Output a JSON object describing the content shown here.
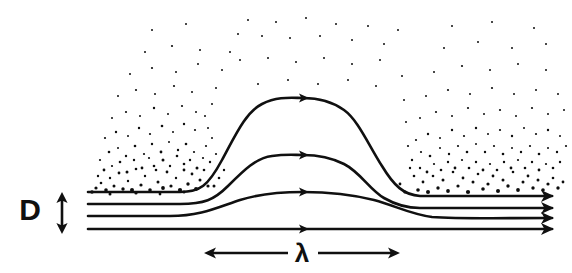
{
  "figure": {
    "type": "schematic-diagram",
    "background_color": "#ffffff",
    "ink_color": "#101010",
    "width": 572,
    "height": 273
  },
  "labels": {
    "depth": {
      "text": "D",
      "meaning": "layer depth",
      "x": 30,
      "y": 220
    },
    "wavelength": {
      "text": "λ",
      "meaning": "wavelength",
      "x": 302,
      "y": 262
    }
  },
  "dimension_arrows": [
    {
      "name": "depth-arrow",
      "orientation": "vertical",
      "double_headed": true,
      "x": 62,
      "y_top": 192,
      "y_bottom": 234
    },
    {
      "name": "wavelength-arrow-left",
      "orientation": "horizontal",
      "double_headed": false,
      "head": "left",
      "y": 253,
      "x_start": 288,
      "x_end": 204
    },
    {
      "name": "wavelength-arrow-right",
      "orientation": "horizontal",
      "double_headed": false,
      "head": "right",
      "y": 253,
      "x_start": 318,
      "x_end": 400
    }
  ],
  "streamlines": [
    {
      "name": "streamline-top",
      "index": 0,
      "y_inlet": 192,
      "y_outlet": 196,
      "crest_y": 98,
      "crest_x": 303,
      "amplitude": 94,
      "path": "M 88 192 L 180 192 C 200 192 208 186 222 160 C 236 134 246 112 262 104 C 278 96 292 98 303 98 C 316 98 330 100 344 110 C 358 120 368 144 382 166 C 394 186 404 195 420 196 L 552 196",
      "arrow_at_x": 303
    },
    {
      "name": "streamline-second",
      "index": 1,
      "y_inlet": 204,
      "y_outlet": 208,
      "crest_y": 155,
      "crest_x": 303,
      "amplitude": 50,
      "path": "M 88 204 L 180 204 C 204 204 214 200 228 186 C 244 170 256 158 272 156 C 286 154 294 155 303 155 C 316 155 330 157 344 164 C 360 172 370 190 384 198 C 396 205 406 208 420 208 L 552 208",
      "arrow_at_x": 303
    },
    {
      "name": "streamline-third",
      "index": 2,
      "y_inlet": 216,
      "y_outlet": 218,
      "crest_y": 192,
      "crest_x": 303,
      "amplitude": 25,
      "path": "M 88 216 L 170 216 C 200 216 216 208 240 200 C 262 193 284 192 303 192 C 326 192 350 194 374 200 C 396 206 410 214 432 217 C 460 219 500 218 552 218",
      "arrow_at_x": 303
    },
    {
      "name": "streamline-bottom",
      "index": 3,
      "y_inlet": 229,
      "y_outlet": 229,
      "crest_y": 229,
      "crest_x": 303,
      "amplitude": 0,
      "path": "M 88 229 L 552 229",
      "arrow_at_x": 303
    }
  ],
  "outlet_arrow_heads": [
    {
      "name": "outlet-arrow-1",
      "x": 552,
      "y": 196
    },
    {
      "name": "outlet-arrow-2",
      "x": 552,
      "y": 208
    },
    {
      "name": "outlet-arrow-3",
      "x": 552,
      "y": 218
    },
    {
      "name": "outlet-arrow-4",
      "x": 552,
      "y": 229
    }
  ],
  "mid_arrow_heads": [
    {
      "name": "mid-arrow-1",
      "x": 303,
      "y": 98
    },
    {
      "name": "mid-arrow-2",
      "x": 303,
      "y": 155
    },
    {
      "name": "mid-arrow-3",
      "x": 303,
      "y": 192
    },
    {
      "name": "mid-arrow-4",
      "x": 303,
      "y": 229
    }
  ],
  "particle_field": {
    "name": "turbulent-particle-speckle",
    "description": "scattered dots above the top streamline, densest just above the streamline and thinning with height",
    "count": 243,
    "dots": [
      [
        96,
        188,
        1.6
      ],
      [
        101,
        183,
        1.3
      ],
      [
        106,
        190,
        1.8
      ],
      [
        110,
        178,
        1.2
      ],
      [
        114,
        186,
        1.5
      ],
      [
        119,
        173,
        1.4
      ],
      [
        123,
        189,
        1.7
      ],
      [
        128,
        181,
        1.2
      ],
      [
        132,
        190,
        2.0
      ],
      [
        136,
        169,
        1.3
      ],
      [
        141,
        185,
        1.6
      ],
      [
        145,
        176,
        1.2
      ],
      [
        150,
        190,
        1.8
      ],
      [
        154,
        166,
        1.3
      ],
      [
        158,
        182,
        1.5
      ],
      [
        163,
        188,
        1.9
      ],
      [
        167,
        172,
        1.4
      ],
      [
        171,
        186,
        1.6
      ],
      [
        176,
        178,
        1.2
      ],
      [
        180,
        190,
        2.1
      ],
      [
        184,
        164,
        1.3
      ],
      [
        188,
        184,
        1.7
      ],
      [
        192,
        174,
        1.4
      ],
      [
        196,
        189,
        1.9
      ],
      [
        200,
        180,
        1.5
      ],
      [
        204,
        170,
        1.3
      ],
      [
        208,
        186,
        1.6
      ],
      [
        98,
        176,
        1.2
      ],
      [
        104,
        170,
        1.4
      ],
      [
        112,
        166,
        1.1
      ],
      [
        120,
        162,
        1.3
      ],
      [
        127,
        172,
        1.5
      ],
      [
        134,
        160,
        1.2
      ],
      [
        142,
        168,
        1.4
      ],
      [
        149,
        158,
        1.1
      ],
      [
        156,
        170,
        1.3
      ],
      [
        163,
        160,
        1.5
      ],
      [
        170,
        166,
        1.2
      ],
      [
        177,
        156,
        1.3
      ],
      [
        184,
        170,
        1.4
      ],
      [
        190,
        160,
        1.2
      ],
      [
        197,
        168,
        1.5
      ],
      [
        203,
        158,
        1.1
      ],
      [
        100,
        160,
        1.1
      ],
      [
        109,
        152,
        1.3
      ],
      [
        118,
        148,
        1.0
      ],
      [
        126,
        156,
        1.2
      ],
      [
        135,
        146,
        1.3
      ],
      [
        144,
        154,
        1.1
      ],
      [
        152,
        144,
        1.2
      ],
      [
        161,
        152,
        1.4
      ],
      [
        169,
        142,
        1.0
      ],
      [
        178,
        150,
        1.2
      ],
      [
        186,
        144,
        1.3
      ],
      [
        194,
        152,
        1.1
      ],
      [
        105,
        138,
        1.1
      ],
      [
        116,
        132,
        1.2
      ],
      [
        128,
        136,
        1.0
      ],
      [
        139,
        128,
        1.2
      ],
      [
        150,
        134,
        1.1
      ],
      [
        162,
        126,
        1.3
      ],
      [
        173,
        132,
        1.0
      ],
      [
        184,
        124,
        1.2
      ],
      [
        195,
        130,
        1.1
      ],
      [
        112,
        118,
        1.0
      ],
      [
        126,
        112,
        1.1
      ],
      [
        140,
        116,
        1.0
      ],
      [
        154,
        108,
        1.2
      ],
      [
        168,
        114,
        1.0
      ],
      [
        182,
        106,
        1.1
      ],
      [
        196,
        112,
        1.0
      ],
      [
        118,
        96,
        1.0
      ],
      [
        136,
        90,
        1.1
      ],
      [
        155,
        94,
        1.0
      ],
      [
        174,
        86,
        1.1
      ],
      [
        192,
        92,
        1.0
      ],
      [
        130,
        74,
        1.0
      ],
      [
        152,
        68,
        1.1
      ],
      [
        176,
        72,
        1.0
      ],
      [
        198,
        64,
        1.0
      ],
      [
        145,
        52,
        1.0
      ],
      [
        172,
        46,
        1.1
      ],
      [
        200,
        50,
        1.0
      ],
      [
        152,
        30,
        1.0
      ],
      [
        186,
        24,
        1.0
      ],
      [
        418,
        190,
        1.8
      ],
      [
        423,
        182,
        1.4
      ],
      [
        428,
        192,
        2.0
      ],
      [
        433,
        176,
        1.3
      ],
      [
        438,
        188,
        1.7
      ],
      [
        443,
        180,
        1.5
      ],
      [
        448,
        191,
        1.9
      ],
      [
        453,
        172,
        1.3
      ],
      [
        458,
        186,
        1.6
      ],
      [
        463,
        178,
        1.4
      ],
      [
        468,
        192,
        2.1
      ],
      [
        473,
        182,
        1.5
      ],
      [
        478,
        174,
        1.3
      ],
      [
        483,
        189,
        1.8
      ],
      [
        488,
        184,
        1.6
      ],
      [
        493,
        176,
        1.4
      ],
      [
        498,
        191,
        2.0
      ],
      [
        503,
        180,
        1.5
      ],
      [
        508,
        186,
        1.7
      ],
      [
        513,
        172,
        1.3
      ],
      [
        518,
        190,
        1.9
      ],
      [
        523,
        182,
        1.5
      ],
      [
        528,
        176,
        1.4
      ],
      [
        533,
        188,
        1.7
      ],
      [
        538,
        180,
        1.5
      ],
      [
        543,
        190,
        1.8
      ],
      [
        548,
        184,
        1.6
      ],
      [
        553,
        178,
        1.3
      ],
      [
        558,
        188,
        1.7
      ],
      [
        563,
        182,
        1.4
      ],
      [
        414,
        176,
        1.3
      ],
      [
        420,
        168,
        1.2
      ],
      [
        427,
        172,
        1.4
      ],
      [
        434,
        164,
        1.1
      ],
      [
        441,
        170,
        1.3
      ],
      [
        448,
        162,
        1.2
      ],
      [
        455,
        168,
        1.4
      ],
      [
        462,
        160,
        1.1
      ],
      [
        469,
        168,
        1.3
      ],
      [
        476,
        162,
        1.2
      ],
      [
        483,
        170,
        1.4
      ],
      [
        490,
        164,
        1.1
      ],
      [
        497,
        170,
        1.3
      ],
      [
        504,
        162,
        1.2
      ],
      [
        511,
        168,
        1.4
      ],
      [
        518,
        160,
        1.1
      ],
      [
        525,
        168,
        1.3
      ],
      [
        532,
        162,
        1.2
      ],
      [
        539,
        170,
        1.4
      ],
      [
        546,
        164,
        1.1
      ],
      [
        553,
        168,
        1.3
      ],
      [
        560,
        162,
        1.2
      ],
      [
        412,
        160,
        1.2
      ],
      [
        421,
        152,
        1.1
      ],
      [
        430,
        156,
        1.3
      ],
      [
        440,
        148,
        1.0
      ],
      [
        449,
        154,
        1.2
      ],
      [
        458,
        146,
        1.1
      ],
      [
        467,
        152,
        1.3
      ],
      [
        476,
        144,
        1.0
      ],
      [
        485,
        152,
        1.2
      ],
      [
        494,
        146,
        1.1
      ],
      [
        503,
        154,
        1.3
      ],
      [
        512,
        148,
        1.0
      ],
      [
        521,
        152,
        1.2
      ],
      [
        530,
        146,
        1.1
      ],
      [
        539,
        154,
        1.3
      ],
      [
        548,
        148,
        1.0
      ],
      [
        557,
        152,
        1.2
      ],
      [
        566,
        146,
        1.1
      ],
      [
        416,
        140,
        1.1
      ],
      [
        428,
        134,
        1.2
      ],
      [
        440,
        138,
        1.0
      ],
      [
        452,
        130,
        1.2
      ],
      [
        464,
        136,
        1.1
      ],
      [
        476,
        128,
        1.2
      ],
      [
        488,
        134,
        1.0
      ],
      [
        500,
        130,
        1.1
      ],
      [
        512,
        136,
        1.2
      ],
      [
        524,
        128,
        1.0
      ],
      [
        536,
        134,
        1.1
      ],
      [
        548,
        130,
        1.2
      ],
      [
        560,
        136,
        1.0
      ],
      [
        420,
        118,
        1.0
      ],
      [
        436,
        112,
        1.1
      ],
      [
        452,
        116,
        1.0
      ],
      [
        468,
        108,
        1.1
      ],
      [
        484,
        114,
        1.0
      ],
      [
        500,
        110,
        1.1
      ],
      [
        516,
        116,
        1.0
      ],
      [
        532,
        108,
        1.1
      ],
      [
        548,
        114,
        1.0
      ],
      [
        564,
        110,
        1.0
      ],
      [
        426,
        96,
        1.0
      ],
      [
        448,
        90,
        1.1
      ],
      [
        470,
        94,
        1.0
      ],
      [
        492,
        88,
        1.1
      ],
      [
        514,
        94,
        1.0
      ],
      [
        536,
        90,
        1.0
      ],
      [
        558,
        94,
        1.0
      ],
      [
        434,
        72,
        1.0
      ],
      [
        462,
        66,
        1.1
      ],
      [
        490,
        70,
        1.0
      ],
      [
        518,
        64,
        1.0
      ],
      [
        546,
        70,
        1.0
      ],
      [
        444,
        48,
        1.0
      ],
      [
        478,
        42,
        1.0
      ],
      [
        512,
        48,
        1.0
      ],
      [
        546,
        44,
        1.0
      ],
      [
        452,
        26,
        1.0
      ],
      [
        492,
        22,
        1.0
      ],
      [
        534,
        28,
        1.0
      ],
      [
        214,
        186,
        1.5
      ],
      [
        219,
        178,
        1.3
      ],
      [
        224,
        170,
        1.2
      ],
      [
        210,
        162,
        1.2
      ],
      [
        216,
        154,
        1.1
      ],
      [
        206,
        146,
        1.1
      ],
      [
        212,
        138,
        1.0
      ],
      [
        208,
        128,
        1.0
      ],
      [
        205,
        116,
        1.0
      ],
      [
        212,
        104,
        1.0
      ],
      [
        216,
        88,
        1.0
      ],
      [
        222,
        70,
        1.0
      ],
      [
        230,
        52,
        1.0
      ],
      [
        238,
        34,
        1.0
      ],
      [
        248,
        20,
        1.0
      ],
      [
        262,
        36,
        1.0
      ],
      [
        276,
        22,
        1.0
      ],
      [
        290,
        38,
        1.0
      ],
      [
        306,
        18,
        1.0
      ],
      [
        320,
        36,
        1.0
      ],
      [
        336,
        24,
        1.0
      ],
      [
        352,
        40,
        1.0
      ],
      [
        368,
        26,
        1.0
      ],
      [
        384,
        44,
        1.0
      ],
      [
        398,
        30,
        1.0
      ],
      [
        240,
        60,
        1.0
      ],
      [
        268,
        58,
        1.0
      ],
      [
        296,
        62,
        1.0
      ],
      [
        324,
        58,
        1.0
      ],
      [
        352,
        64,
        1.0
      ],
      [
        380,
        60,
        1.0
      ],
      [
        258,
        84,
        1.0
      ],
      [
        288,
        80,
        1.0
      ],
      [
        318,
        84,
        1.0
      ],
      [
        348,
        80,
        1.0
      ],
      [
        376,
        86,
        1.0
      ],
      [
        402,
        76,
        1.0
      ],
      [
        404,
        100,
        1.0
      ],
      [
        406,
        122,
        1.0
      ],
      [
        408,
        146,
        1.1
      ],
      [
        410,
        168,
        1.2
      ],
      [
        400,
        184,
        1.4
      ],
      [
        405,
        192,
        1.6
      ],
      [
        92,
        192,
        1.8
      ],
      [
        110,
        194,
        1.5
      ],
      [
        136,
        193,
        1.6
      ],
      [
        160,
        194,
        1.4
      ],
      [
        184,
        192,
        1.5
      ]
    ]
  }
}
